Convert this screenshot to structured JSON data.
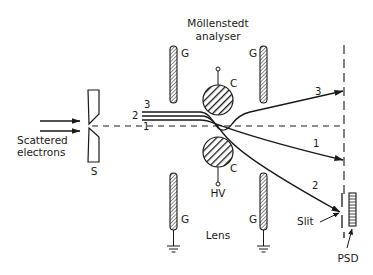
{
  "title": {
    "line1": "Möllenstedt",
    "line2": "analyser"
  },
  "labels": {
    "source": {
      "line1": "Scattered",
      "line2": "electrons"
    },
    "slit_aperture": "S",
    "electrode_grounded": "G",
    "electrode_center": "C",
    "high_voltage": "HV",
    "lens": "Lens",
    "exit_slit": "Slit",
    "detector": "PSD"
  },
  "beams": [
    {
      "id": "1",
      "label": "1"
    },
    {
      "id": "2",
      "label": "2"
    },
    {
      "id": "3",
      "label": "3"
    }
  ],
  "colors": {
    "ink": "#1a1a1a",
    "background": "#ffffff"
  }
}
